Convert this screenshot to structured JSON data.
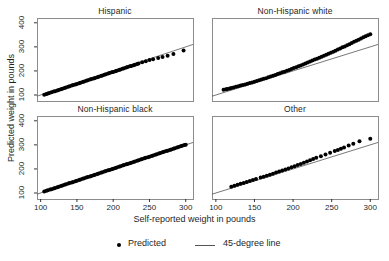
{
  "chart_data": {
    "type": "scatter",
    "title": "",
    "xlabel": "Self-reported weight in pounds",
    "ylabel": "Predicted weight in pounds",
    "xlim": [
      95,
      310
    ],
    "ylim": [
      75,
      420
    ],
    "xticks": [
      100,
      150,
      200,
      250,
      300
    ],
    "yticks": [
      100,
      200,
      300,
      400
    ],
    "grid": false,
    "legend_position": "bottom",
    "legend": [
      {
        "label": "Predicted",
        "marker": "dot",
        "color": "#000000"
      },
      {
        "label": "45-degree line",
        "marker": "line",
        "color": "#555555"
      }
    ],
    "reference_line": {
      "name": "45-degree line",
      "slope": 1,
      "intercept": 0,
      "color": "#555555"
    },
    "panels": [
      {
        "title": "Hispanic",
        "row": 0,
        "col": 0,
        "series_name": "Predicted",
        "x": [
          105,
          108,
          110,
          112,
          115,
          118,
          120,
          123,
          125,
          128,
          130,
          133,
          135,
          138,
          140,
          143,
          145,
          148,
          150,
          153,
          155,
          158,
          160,
          163,
          165,
          168,
          170,
          173,
          175,
          178,
          180,
          183,
          185,
          188,
          190,
          193,
          195,
          198,
          200,
          203,
          205,
          208,
          210,
          213,
          215,
          218,
          220,
          223,
          225,
          228,
          230,
          233,
          235,
          240,
          245,
          250,
          255,
          262,
          268,
          275,
          283,
          297
        ],
        "y": [
          101,
          104,
          106,
          108,
          111,
          114,
          116,
          119,
          121,
          124,
          126,
          129,
          131,
          134,
          136,
          139,
          141,
          144,
          146,
          149,
          151,
          154,
          156,
          159,
          161,
          164,
          166,
          169,
          171,
          174,
          176,
          179,
          181,
          184,
          186,
          189,
          191,
          194,
          196,
          199,
          201,
          204,
          206,
          209,
          211,
          214,
          216,
          219,
          221,
          224,
          226,
          229,
          231,
          236,
          240,
          245,
          249,
          254,
          258,
          263,
          270,
          285
        ]
      },
      {
        "title": "Non-Hispanic white",
        "row": 0,
        "col": 1,
        "series_name": "Predicted",
        "x": [
          110,
          113,
          115,
          118,
          120,
          123,
          126,
          129,
          132,
          135,
          138,
          141,
          144,
          147,
          150,
          153,
          156,
          159,
          162,
          165,
          168,
          171,
          174,
          177,
          180,
          183,
          186,
          189,
          192,
          195,
          198,
          201,
          204,
          207,
          210,
          213,
          216,
          219,
          222,
          225,
          228,
          231,
          234,
          237,
          240,
          243,
          246,
          249,
          252,
          255,
          258,
          261,
          264,
          267,
          270,
          273,
          276,
          279,
          282,
          285,
          288,
          291,
          294,
          297,
          300
        ],
        "y": [
          122,
          124,
          125,
          127,
          129,
          131,
          134,
          136,
          139,
          141,
          144,
          147,
          150,
          152,
          155,
          158,
          161,
          164,
          167,
          170,
          174,
          177,
          180,
          183,
          187,
          190,
          194,
          197,
          201,
          204,
          208,
          212,
          215,
          219,
          223,
          227,
          231,
          235,
          239,
          243,
          247,
          251,
          255,
          259,
          263,
          267,
          271,
          276,
          280,
          284,
          289,
          293,
          298,
          302,
          307,
          311,
          316,
          321,
          325,
          330,
          335,
          340,
          344,
          348,
          352
        ]
      },
      {
        "title": "Non-Hispanic black",
        "row": 1,
        "col": 0,
        "series_name": "Predicted",
        "x": [
          105,
          108,
          110,
          113,
          115,
          118,
          120,
          123,
          125,
          128,
          130,
          133,
          135,
          138,
          140,
          143,
          145,
          148,
          150,
          153,
          155,
          158,
          160,
          163,
          165,
          168,
          170,
          173,
          175,
          178,
          180,
          183,
          185,
          188,
          190,
          193,
          195,
          198,
          200,
          203,
          205,
          208,
          210,
          213,
          215,
          218,
          220,
          223,
          225,
          228,
          230,
          233,
          235,
          238,
          240,
          243,
          245,
          248,
          250,
          253,
          255,
          258,
          260,
          263,
          265,
          268,
          270,
          273,
          275,
          278,
          280,
          283,
          285,
          288,
          290,
          293,
          295,
          298,
          300
        ],
        "y": [
          106,
          109,
          111,
          114,
          116,
          119,
          121,
          124,
          126,
          129,
          131,
          134,
          136,
          139,
          141,
          144,
          146,
          149,
          151,
          154,
          156,
          159,
          161,
          164,
          166,
          169,
          171,
          174,
          176,
          179,
          181,
          184,
          186,
          189,
          191,
          194,
          196,
          199,
          201,
          204,
          206,
          209,
          211,
          214,
          216,
          219,
          221,
          224,
          226,
          229,
          231,
          234,
          236,
          239,
          241,
          244,
          246,
          249,
          251,
          254,
          256,
          259,
          261,
          264,
          266,
          269,
          271,
          274,
          276,
          279,
          281,
          284,
          286,
          289,
          291,
          294,
          296,
          299,
          301
        ]
      },
      {
        "title": "Other",
        "row": 1,
        "col": 1,
        "series_name": "Predicted",
        "x": [
          120,
          124,
          128,
          132,
          136,
          140,
          144,
          148,
          152,
          158,
          162,
          166,
          170,
          174,
          178,
          182,
          186,
          190,
          194,
          198,
          202,
          206,
          210,
          214,
          218,
          222,
          226,
          230,
          236,
          242,
          248,
          254,
          258,
          262,
          266,
          272,
          278,
          286,
          300
        ],
        "y": [
          126,
          130,
          134,
          138,
          142,
          146,
          150,
          154,
          158,
          164,
          168,
          172,
          176,
          180,
          185,
          189,
          193,
          198,
          202,
          207,
          211,
          216,
          221,
          226,
          231,
          236,
          241,
          246,
          253,
          260,
          267,
          274,
          279,
          284,
          289,
          297,
          305,
          315,
          325
        ]
      }
    ]
  }
}
